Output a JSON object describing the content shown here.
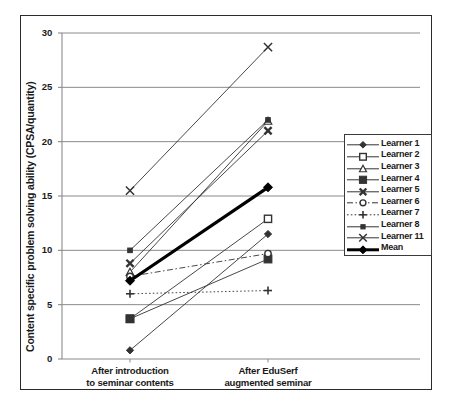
{
  "chart_data": {
    "type": "line",
    "title": "",
    "xlabel": "",
    "ylabel": "Content specific problem solving ability (CPSA/quantity)",
    "categories": [
      "After introduction to seminar contents",
      "After EduSerf augmented seminar"
    ],
    "category_lines": [
      [
        "After introduction",
        "to seminar contents"
      ],
      [
        "After EduSerf",
        "augmented seminar"
      ]
    ],
    "ylim": [
      0,
      30
    ],
    "yticks": [
      0,
      5,
      10,
      15,
      20,
      25,
      30
    ],
    "ytick_labels": [
      "0",
      "5",
      "10",
      "15",
      "20",
      "25",
      "30"
    ],
    "grid": "horizontal",
    "legend_position": "right",
    "series": [
      {
        "name": "Learner 1",
        "values": [
          0.8,
          11.5
        ],
        "marker": "filled-diamond",
        "line": "solid",
        "width": 0.9
      },
      {
        "name": "Learner 2",
        "values": [
          3.7,
          12.9
        ],
        "marker": "open-square",
        "line": "solid",
        "width": 0.9
      },
      {
        "name": "Learner 3",
        "values": [
          8.0,
          21.9
        ],
        "marker": "open-triangle",
        "line": "solid",
        "width": 0.9
      },
      {
        "name": "Learner 4",
        "values": [
          3.7,
          9.2
        ],
        "marker": "filled-square",
        "line": "solid",
        "width": 0.9
      },
      {
        "name": "Learner 5",
        "values": [
          8.8,
          21.0
        ],
        "marker": "bold-x",
        "line": "solid",
        "width": 0.9
      },
      {
        "name": "Learner 6",
        "values": [
          7.6,
          9.7
        ],
        "marker": "open-circle",
        "line": "dashed",
        "width": 0.9
      },
      {
        "name": "Learner 7",
        "values": [
          6.0,
          6.3
        ],
        "marker": "plus",
        "line": "dotted",
        "width": 0.9
      },
      {
        "name": "Learner 8",
        "values": [
          10.0,
          22.0
        ],
        "marker": "small-filled-square",
        "line": "solid",
        "width": 0.9
      },
      {
        "name": "Learner 11",
        "values": [
          15.5,
          28.7
        ],
        "marker": "cross-x",
        "line": "solid",
        "width": 0.9
      },
      {
        "name": "Mean",
        "values": [
          7.2,
          15.8
        ],
        "marker": "filled-diamond",
        "line": "solid",
        "width": 3.2
      }
    ]
  },
  "legend": {
    "entries": [
      {
        "label": "Learner 1"
      },
      {
        "label": "Learner 2"
      },
      {
        "label": "Learner 3"
      },
      {
        "label": "Learner 4"
      },
      {
        "label": "Learner 5"
      },
      {
        "label": "Learner 6"
      },
      {
        "label": "Learner 7"
      },
      {
        "label": "Learner 8"
      },
      {
        "label": "Learner 11"
      },
      {
        "label": "Mean"
      }
    ]
  },
  "colors": {
    "line": "#333333",
    "bold_line": "#000000",
    "grid": "#8a8a8a",
    "axis": "#8a8a8a",
    "frame": "#2b2b2b",
    "text": "#1a1a1a",
    "background": "#ffffff"
  }
}
